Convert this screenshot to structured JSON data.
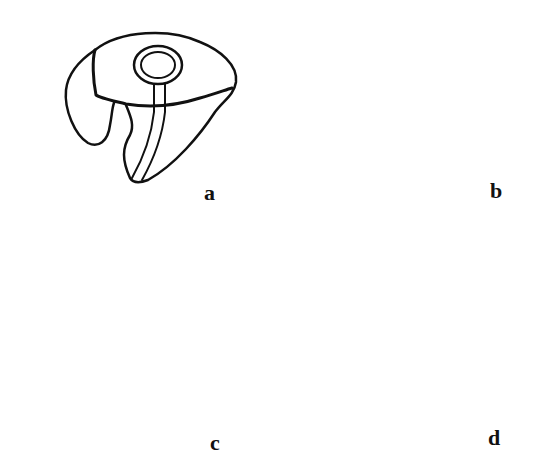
{
  "figure": {
    "panels": [
      {
        "id": "a",
        "label": "a",
        "description": "ear mold with circular sound opening and tube channel"
      },
      {
        "id": "b",
        "label": "b",
        "description": "ear mold with tube arching over top"
      },
      {
        "id": "c",
        "label": "c",
        "description": "skeleton-style ear mold with tube arching over open concha ring"
      },
      {
        "id": "d",
        "label": "d",
        "description": "open skeleton ear mold with tube, ring band and canal stub"
      }
    ],
    "colors": {
      "ink": "#111111",
      "background": "#ffffff"
    }
  }
}
